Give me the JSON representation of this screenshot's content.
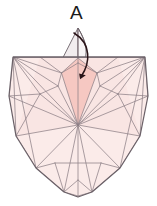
{
  "figure": {
    "background_color": "#ffffff",
    "width": 157,
    "height": 206
  },
  "labels": [
    {
      "id": "A",
      "text": "A",
      "x": 78,
      "y": 14,
      "color": "#1a1a1a",
      "font_size": 19
    }
  ],
  "colors": {
    "outline_stroke": "#6b6168",
    "mesh_stroke": "#8d8087",
    "light_fill": "#fbebe9",
    "mid_fill": "#f7ddda",
    "highlight_fill": "#f6c8c2",
    "spire_fill": "#f2eef0",
    "arrow_color": "#2a1418",
    "label_color": "#1a1a1a"
  },
  "geometry": {
    "outline_points": "13,57 145,57 148,96 140,136 120,168 92,192 78,197 64,192 36,168 16,136 9,96 13,57",
    "top_edge": {
      "x1": 13,
      "y1": 57,
      "x2": 145,
      "y2": 57
    },
    "hub": {
      "x": 78,
      "y": 125
    },
    "bottom_apex": {
      "x": 78,
      "y": 196
    },
    "spire_apex": {
      "x": 78,
      "y": 28
    },
    "highlight_kite": "78,58 62,73 78,125 97,73",
    "spire_left_path": "M 78,28 L 63,58 L 78,62 Z",
    "spire_right_path": "M 78,28 C 86,42 88,54 83,62 L 78,62 Z"
  },
  "mesh": {
    "description": "Triangulated polygon mesh, bilaterally symmetric about x=78",
    "radial_lines_from_hub": [
      "13,57",
      "40,57",
      "62,73",
      "97,73",
      "118,57",
      "145,57",
      "16,136",
      "36,168",
      "64,192",
      "78,196",
      "92,192",
      "120,168",
      "140,136",
      "9,96",
      "148,96",
      "78,57"
    ]
  },
  "arrow": {
    "label": "fold-arrow",
    "path": "M 74,34 C 92,44 90,62 82,76",
    "head_point": {
      "x": 79,
      "y": 82
    },
    "color": "#2a1418"
  }
}
